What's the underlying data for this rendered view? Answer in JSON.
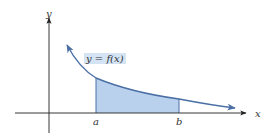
{
  "figure": {
    "axes": {
      "x_label": "x",
      "y_label": "y"
    },
    "curve_label": "y = f(x)",
    "bounds": {
      "lower": "a",
      "upper": "b"
    },
    "colors": {
      "axis": "#222222",
      "curve": "#4a6fa5",
      "shaded_region": "#b9d1ec",
      "label_box": "#d4e4f4",
      "text": "#333333"
    }
  }
}
